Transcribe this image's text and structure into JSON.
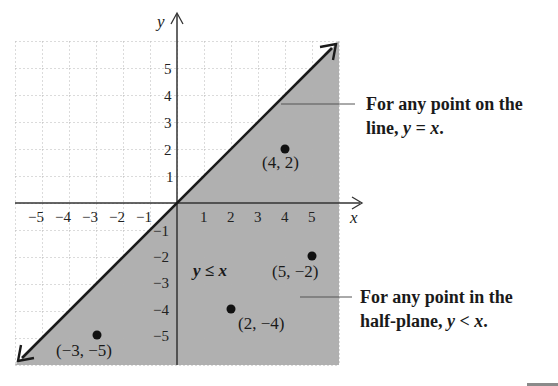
{
  "diagram": {
    "axes": {
      "x_label": "x",
      "y_label": "y",
      "x_ticks_negative": [
        "−5",
        "−4",
        "−3",
        "−2",
        "−1"
      ],
      "x_ticks_positive": [
        "1",
        "2",
        "3",
        "4",
        "5"
      ],
      "y_ticks_positive": [
        "5",
        "4",
        "3",
        "2",
        "1"
      ],
      "y_ticks_negative": [
        "−1",
        "−2",
        "−3",
        "−4",
        "−5"
      ],
      "range": [
        -6,
        6
      ]
    },
    "boundary_line": "y = x",
    "region_label": "y ≤ x",
    "points": [
      {
        "label": "(4, 2)",
        "x": 4,
        "y": 2
      },
      {
        "label": "(5, −2)",
        "x": 5,
        "y": -2
      },
      {
        "label": "(2, −4)",
        "x": 2,
        "y": -4
      },
      {
        "label": "(−3, −5)",
        "x": -3,
        "y": -5
      }
    ],
    "callouts": {
      "line": {
        "line1": "For any point on the",
        "line2_prefix": "line, ",
        "line2_math": "y = x",
        "line2_suffix": "."
      },
      "half_plane": {
        "line1": "For any point in the",
        "line2_prefix": "half-plane, ",
        "line2_math": "y < x",
        "line2_suffix": "."
      }
    },
    "colors": {
      "shade": "#a9a9a9",
      "grid": "#b5b5b5",
      "axis": "#333333",
      "line": "#1a1a1a"
    }
  }
}
